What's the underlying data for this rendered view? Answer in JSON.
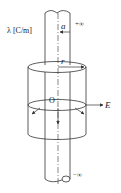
{
  "diagram": {
    "labels": {
      "charge_density": "λ [C/m]",
      "radius_small": "a",
      "plus_infinity": "+∞",
      "minus_infinity": "−∞",
      "radius_r": "r",
      "origin": "O",
      "field": "E"
    },
    "colors": {
      "stroke": "#333333",
      "background": "#ffffff"
    }
  }
}
